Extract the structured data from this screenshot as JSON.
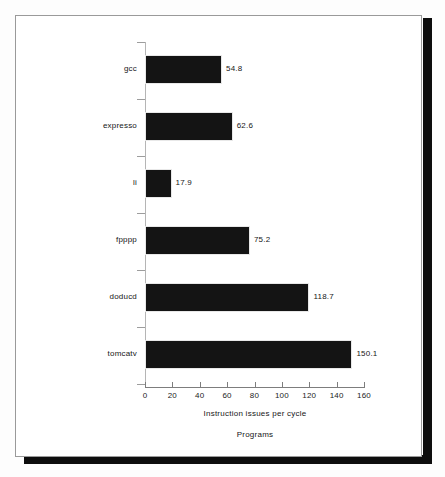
{
  "figure": {
    "background_color": "#ffffff",
    "frame_color": "#9a9a9a",
    "shadow_color": "#0d0d0d",
    "bar_color": "#141414"
  },
  "chart_data": {
    "type": "bar",
    "orientation": "horizontal",
    "title": "",
    "subtitle": "",
    "xlabel": "Instruction issues per cycle",
    "ylabel": "Programs",
    "categories": [
      "gcc",
      "expresso",
      "li",
      "fpppp",
      "doducd",
      "tomcatv"
    ],
    "values": [
      54.8,
      62.6,
      17.9,
      75.2,
      118.7,
      150.1
    ],
    "value_labels": [
      "54.8",
      "62.6",
      "17.9",
      "75.2",
      "118.7",
      "150.1"
    ],
    "xlim": [
      0,
      160
    ],
    "xticks": [
      0,
      20,
      40,
      60,
      80,
      100,
      120,
      140,
      160
    ],
    "xticklabels": [
      "0",
      "20",
      "40",
      "60",
      "80",
      "100",
      "120",
      "140",
      "160"
    ],
    "grid": false,
    "legend": null,
    "legend_position": "none",
    "series": [
      {
        "name": "Instruction issues per cycle",
        "values": [
          54.8,
          62.6,
          17.9,
          75.2,
          118.7,
          150.1
        ]
      }
    ]
  }
}
